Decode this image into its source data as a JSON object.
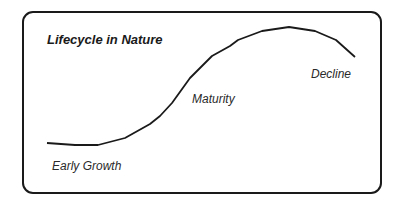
{
  "diagram": {
    "title": "Lifecycle in Nature",
    "stages": [
      {
        "label": "Early Growth"
      },
      {
        "label": "Maturity"
      },
      {
        "label": "Decline"
      }
    ],
    "curve": {
      "type": "line",
      "description": "Rise-plateau-decline lifecycle curve",
      "stroke_color": "#1a1a1a"
    }
  }
}
